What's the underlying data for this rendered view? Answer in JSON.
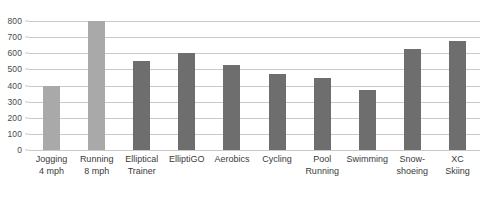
{
  "chart_data": {
    "type": "bar",
    "title": "",
    "xlabel": "",
    "ylabel": "",
    "ylim": [
      0,
      800
    ],
    "yticks": [
      0,
      100,
      200,
      300,
      400,
      500,
      600,
      700,
      800
    ],
    "ytick_labels": [
      "0",
      "100",
      "200",
      "300",
      "400",
      "500",
      "600",
      "700",
      "800"
    ],
    "grid": true,
    "legend": "none",
    "categories": [
      "Jogging 4 mph",
      "Running 8 mph",
      "Elliptical Trainer",
      "ElliptiGO",
      "Aerobics",
      "Cycling",
      "Pool Running",
      "Swimming",
      "Snow-shoeing",
      "XC Skiing"
    ],
    "category_lines": [
      [
        "Jogging",
        "4 mph"
      ],
      [
        "Running",
        "8 mph"
      ],
      [
        "Elliptical",
        "Trainer"
      ],
      [
        "ElliptiGO",
        ""
      ],
      [
        "Aerobics",
        ""
      ],
      [
        "Cycling",
        ""
      ],
      [
        "Pool",
        "Running"
      ],
      [
        "Swimming",
        ""
      ],
      [
        "Snow-",
        "shoeing"
      ],
      [
        "XC",
        "Skiing"
      ]
    ],
    "values": [
      400,
      800,
      550,
      600,
      525,
      470,
      445,
      375,
      625,
      675
    ],
    "bar_colors": [
      "#a9a9a9",
      "#a9a9a9",
      "#6e6e6e",
      "#6e6e6e",
      "#6e6e6e",
      "#6e6e6e",
      "#6e6e6e",
      "#6e6e6e",
      "#6e6e6e",
      "#6e6e6e"
    ]
  },
  "style": {
    "gridline_color": "#c9c9c9",
    "background": "#ffffff",
    "text_color": "#3a3a3a"
  }
}
